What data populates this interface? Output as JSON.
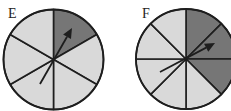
{
  "colors": {
    "light_sector": "#d9d9d9",
    "dark_sector": "#767676",
    "line": "#1e1e1e",
    "background": "#ffffff"
  },
  "spinners": [
    {
      "label": "E",
      "sectors": 6,
      "shaded_sectors": [
        0
      ],
      "shaded_fraction": "1/6",
      "center": [
        53.5,
        59.5
      ],
      "radius": 50,
      "arrow": {
        "from": [
          40,
          84
        ],
        "to": [
          72,
          28
        ]
      }
    },
    {
      "label": "F",
      "sectors": 8,
      "shaded_sectors": [
        0,
        1,
        2
      ],
      "shaded_fraction": "3/8",
      "center": [
        186,
        59
      ],
      "radius": 50,
      "arrow": {
        "from": [
          160,
          72
        ],
        "to": [
          215,
          43
        ]
      }
    }
  ]
}
